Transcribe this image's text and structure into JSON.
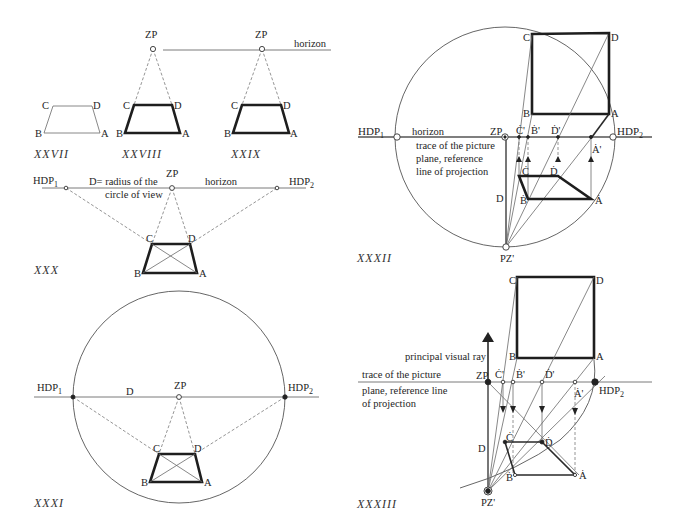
{
  "figures": {
    "xxvii": {
      "caption": "XXVII",
      "labels": {
        "a": "A",
        "b": "B",
        "c": "C",
        "d": "D"
      }
    },
    "xxviii": {
      "caption": "XXVIII",
      "labels": {
        "zp": "ZP",
        "a": "A",
        "b": "B",
        "c": "C",
        "d": "D"
      }
    },
    "xxix": {
      "caption": "XXIX",
      "labels": {
        "zp": "ZP",
        "horizon": "horizon",
        "a": "A",
        "b": "B",
        "c": "C",
        "d": "D"
      }
    },
    "xxx": {
      "caption": "XXX",
      "labels": {
        "hdp1": "HDP",
        "hdp1_sub": "1",
        "hdp2": "HDP",
        "hdp2_sub": "2",
        "zp": "ZP",
        "horizon": "horizon",
        "d_note_line1": "D= radius of the",
        "d_note_line2": "circle of view",
        "a": "A",
        "b": "B",
        "c": "C",
        "d": "D"
      }
    },
    "xxxi": {
      "caption": "XXXI",
      "labels": {
        "hdp1": "HDP",
        "hdp1_sub": "1",
        "hdp2": "HDP",
        "hdp2_sub": "2",
        "zp": "ZP",
        "d": "D",
        "a": "A",
        "b": "B",
        "c": "C",
        "dpt": "D"
      }
    },
    "xxxii": {
      "caption": "XXXII",
      "labels": {
        "hdp1": "HDP",
        "hdp1_sub": "1",
        "hdp2": "HDP",
        "hdp2_sub": "2",
        "horizon": "horizon",
        "zp": "ZP",
        "pz": "PZ'",
        "trace_line1": "trace of the picture",
        "trace_line2": "plane, reference",
        "trace_line3": "line of projection",
        "d": "D",
        "plan_a": "A",
        "plan_b": "B",
        "plan_c": "C",
        "plan_d": "D",
        "c_prime": "Ċ'",
        "b_prime": "Ḃ'",
        "d_prime": "Ḋ'",
        "a_prime": "Ȧ'",
        "persp_a": "Ȧ",
        "persp_b": "Ḃ",
        "persp_c": "Ċ",
        "persp_d": "Ḋ"
      }
    },
    "xxxiii": {
      "caption": "XXXIII",
      "labels": {
        "principal_ray": "principal visual ray",
        "trace_line1": "trace of the picture",
        "trace_line2": "plane, reference line",
        "trace_line3": "of projection",
        "zp": "ZP",
        "hdp2": "HDP",
        "hdp2_sub": "2",
        "pz": "PZ'",
        "d": "D",
        "plan_a": "A",
        "plan_b": "B",
        "plan_c": "C",
        "plan_d": "D",
        "c_prime": "Ċ'",
        "b_prime": "Ḃ'",
        "d_prime": "Ḋ'",
        "a_prime": "Ȧ'",
        "persp_a": "Ȧ",
        "persp_b": "Ḃ",
        "persp_c": "Ċ",
        "persp_d": "Ḋ"
      }
    }
  }
}
